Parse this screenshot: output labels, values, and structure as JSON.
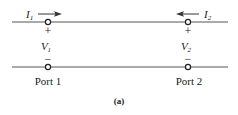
{
  "diagram": {
    "caption": "(a)",
    "wire_color": "#555555",
    "text_color": "#1a1a1a",
    "ports": [
      {
        "label": "Port 1",
        "current": {
          "symbol": "I",
          "subscript": "1",
          "direction": "right"
        },
        "voltage": {
          "symbol": "V",
          "subscript": "1",
          "plus": "+",
          "minus": "−"
        }
      },
      {
        "label": "Port 2",
        "current": {
          "symbol": "I",
          "subscript": "2",
          "direction": "left"
        },
        "voltage": {
          "symbol": "V",
          "subscript": "2",
          "plus": "+",
          "minus": "−"
        }
      }
    ]
  }
}
